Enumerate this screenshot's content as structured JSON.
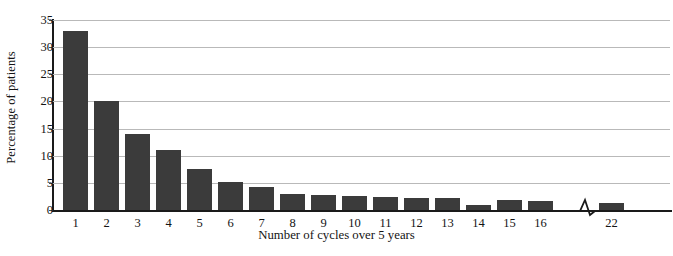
{
  "chart_data": {
    "type": "bar",
    "title": "",
    "xlabel": "Number of cycles over 5 years",
    "ylabel": "Percentage of patients",
    "categories": [
      "1",
      "2",
      "3",
      "4",
      "5",
      "6",
      "7",
      "8",
      "9",
      "10",
      "11",
      "12",
      "13",
      "14",
      "15",
      "16",
      "22"
    ],
    "values": [
      33,
      20,
      14,
      11,
      7.5,
      5.2,
      4.3,
      3.0,
      2.8,
      2.5,
      2.4,
      2.2,
      2.2,
      1.0,
      1.9,
      1.7,
      1.3
    ],
    "ylim": [
      0,
      35
    ],
    "ytick_labels": [
      "0",
      "5",
      "10",
      "15",
      "20",
      "25",
      "30",
      "35"
    ],
    "ytick_values": [
      0,
      5,
      10,
      15,
      20,
      25,
      30,
      35
    ],
    "grid": true,
    "legend": "none",
    "bar_color": "#3b3b3b",
    "gridline_color": "#b9b9b9",
    "axis_color": "#1a1a1a",
    "axis_break": {
      "present": true,
      "between": [
        "16",
        "22"
      ],
      "symbol": "zigzag"
    }
  }
}
